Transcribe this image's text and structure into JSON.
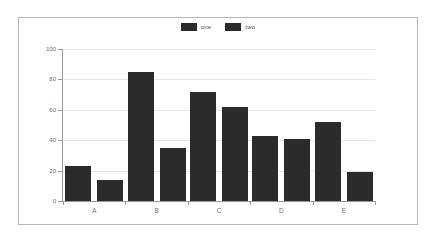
{
  "chart_data": {
    "type": "bar",
    "title": "",
    "subtitle": "",
    "xlabel": "",
    "ylabel": "",
    "categories": [
      "A",
      "B",
      "C",
      "D",
      "E"
    ],
    "series": [
      {
        "name": "one",
        "values": [
          23,
          85,
          72,
          43,
          52
        ],
        "color": "#2b2b2b"
      },
      {
        "name": "two",
        "values": [
          14,
          35,
          62,
          41,
          19
        ],
        "color": "#2b2b2b"
      }
    ],
    "ylim": [
      0,
      100
    ],
    "yticks": [
      0,
      20,
      40,
      60,
      80,
      100
    ],
    "ytick_labels": [
      "0",
      "20",
      "40",
      "60",
      "80",
      "100"
    ],
    "grid": true,
    "legend_position": "top-center",
    "legend_entries": [
      "one",
      "two"
    ],
    "background_color": "#ffffff",
    "grid_color": "#e8e8e8",
    "axis_color": "#9a9a9a",
    "border_color": "#b9b9b9"
  }
}
